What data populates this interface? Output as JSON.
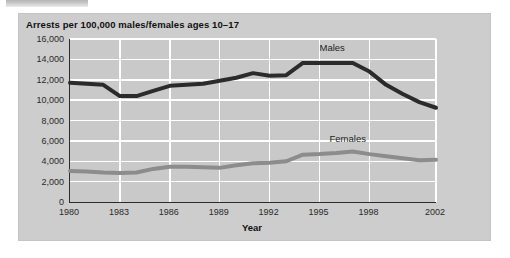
{
  "chart_data": {
    "type": "line",
    "title": "Arrests per 100,000 males/females ages 10–17",
    "xlabel": "Year",
    "ylabel": "",
    "grid": true,
    "legend_position": "inline-annotation",
    "xlim": [
      1980,
      2002
    ],
    "ylim": [
      0,
      16000
    ],
    "ytick_labels": [
      "16,000",
      "14,000",
      "12,000",
      "10,000",
      "8,000",
      "6,000",
      "4,000",
      "2,000",
      "0"
    ],
    "ytick_values": [
      16000,
      14000,
      12000,
      10000,
      8000,
      6000,
      4000,
      2000,
      0
    ],
    "xtick_labels": [
      "1980",
      "1983",
      "1986",
      "1989",
      "1992",
      "1995",
      "1998",
      "2002"
    ],
    "xtick_values": [
      1980,
      1983,
      1986,
      1989,
      1992,
      1995,
      1998,
      2002
    ],
    "x": [
      1980,
      1981,
      1982,
      1983,
      1984,
      1985,
      1986,
      1987,
      1988,
      1989,
      1990,
      1991,
      1992,
      1993,
      1994,
      1995,
      1996,
      1997,
      1998,
      1999,
      2000,
      2001,
      2002
    ],
    "series": [
      {
        "name": "Males",
        "color": "#2b2b2b",
        "values": [
          11700,
          11600,
          11500,
          10400,
          10400,
          10900,
          11400,
          11500,
          11600,
          11900,
          12200,
          12650,
          12400,
          12450,
          13650,
          13650,
          13650,
          13650,
          12800,
          11500,
          10600,
          9800,
          9250
        ]
      },
      {
        "name": "Females",
        "color": "#8c8c8c",
        "values": [
          3050,
          3000,
          2900,
          2850,
          2900,
          3250,
          3450,
          3450,
          3400,
          3350,
          3600,
          3800,
          3850,
          4000,
          4650,
          4700,
          4800,
          4950,
          4700,
          4500,
          4300,
          4100,
          4150
        ]
      }
    ],
    "annotations": [
      {
        "text": "Males",
        "x": 1995,
        "y": 15100
      },
      {
        "text": "Females",
        "x": 1995.6,
        "y": 6150
      }
    ]
  },
  "colors": {
    "panel_background": "#cdcdcd",
    "plot_background": "#c9c9c9",
    "gridline": "#ffffff",
    "axis": "#2b2b2b",
    "males_line": "#2b2b2b",
    "females_line": "#8c8c8c",
    "text": "#1d1d1d"
  }
}
